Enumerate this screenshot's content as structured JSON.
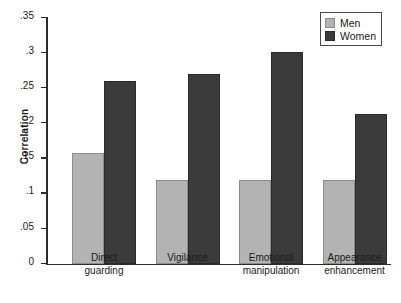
{
  "chart_data": {
    "type": "bar",
    "title": "",
    "xlabel": "",
    "ylabel": "Correlation",
    "ylim": [
      0,
      0.35
    ],
    "ytick_labels": [
      "0",
      ".05",
      ".1",
      ".15",
      ".2",
      ".25",
      ".3",
      ".35"
    ],
    "ytick_values": [
      0,
      0.05,
      0.1,
      0.15,
      0.2,
      0.25,
      0.3,
      0.35
    ],
    "grid": false,
    "legend_position": "top-right",
    "categories": [
      "Direct\nguarding",
      "Vigilance",
      "Emotional\nmanipulation",
      "Appearance\nenhancement"
    ],
    "series": [
      {
        "name": "Men",
        "color": "#b3b3b3",
        "values": [
          0.158,
          0.12,
          0.12,
          0.12
        ]
      },
      {
        "name": "Women",
        "color": "#3b3b3b",
        "values": [
          0.26,
          0.27,
          0.301,
          0.214
        ]
      }
    ]
  },
  "legend": {
    "items": [
      {
        "label": "Men"
      },
      {
        "label": "Women"
      }
    ]
  }
}
